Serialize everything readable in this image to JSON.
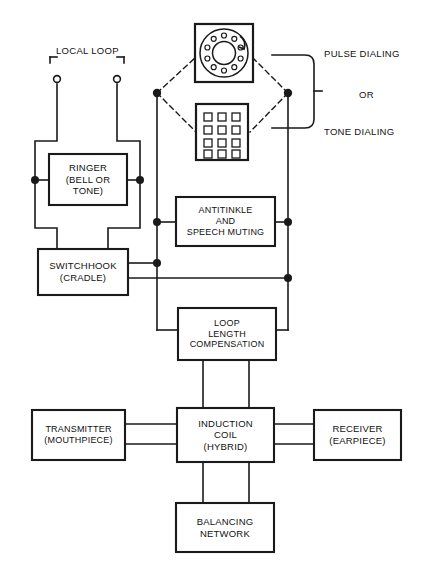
{
  "diagram": {
    "stroke_color": "#1a1a1a",
    "background_color": "#ffffff",
    "blocks": [
      {
        "id": "ringer",
        "lines": [
          "RINGER",
          "(BELL OR",
          "TONE)"
        ],
        "x": 49,
        "y": 154,
        "w": 78,
        "h": 51
      },
      {
        "id": "switchhook",
        "lines": [
          "SWITCHHOOK",
          "(CRADLE)"
        ],
        "x": 38,
        "y": 249,
        "w": 90,
        "h": 46
      },
      {
        "id": "antitinkle",
        "lines": [
          "ANTITINKLE",
          "AND",
          "SPEECH MUTING"
        ],
        "x": 176,
        "y": 197,
        "w": 99,
        "h": 49
      },
      {
        "id": "loop-length",
        "lines": [
          "LOOP",
          "LENGTH",
          "COMPENSATION"
        ],
        "x": 178,
        "y": 308,
        "w": 98,
        "h": 52
      },
      {
        "id": "transmitter",
        "lines": [
          "TRANSMITTER",
          "(MOUTHPIECE)"
        ],
        "x": 32,
        "y": 410,
        "w": 93,
        "h": 50
      },
      {
        "id": "induction-coil",
        "lines": [
          "INDUCTION",
          "COIL",
          "(HYBRID)"
        ],
        "x": 177,
        "y": 408,
        "w": 97,
        "h": 54
      },
      {
        "id": "receiver",
        "lines": [
          "RECEIVER",
          "(EARPIECE)",
          ""
        ],
        "x": 314,
        "y": 410,
        "w": 87,
        "h": 50
      },
      {
        "id": "balancing",
        "lines": [
          "BALANCING",
          "NETWORK"
        ],
        "x": 176,
        "y": 503,
        "w": 98,
        "h": 49
      }
    ],
    "annotations": [
      {
        "id": "local-loop",
        "lines": [
          "LOCAL",
          "LOOP"
        ],
        "x": 56,
        "y": 45,
        "w": 62,
        "align": "center"
      },
      {
        "id": "pulse-dialing",
        "lines": [
          "PULSE DIALING"
        ],
        "x": 324,
        "y": 48,
        "w": 100,
        "align": "left"
      },
      {
        "id": "or",
        "lines": [
          "OR"
        ],
        "x": 359,
        "y": 89,
        "w": 30,
        "align": "left"
      },
      {
        "id": "tone-dialing",
        "lines": [
          "TONE DIALING"
        ],
        "x": 324,
        "y": 126,
        "w": 100,
        "align": "left"
      }
    ],
    "devices": [
      {
        "id": "rotary-dial",
        "name": "rotary-dial-icon",
        "x": 195,
        "y": 24,
        "w": 58,
        "h": 58,
        "finger_holes": 10
      },
      {
        "id": "keypad",
        "name": "keypad-icon",
        "x": 196,
        "y": 104,
        "w": 52,
        "h": 56,
        "rows": 4,
        "cols": 3
      }
    ],
    "terminals": [
      {
        "id": "terminal-tip",
        "x": 57,
        "y": 79
      },
      {
        "id": "terminal-ring",
        "x": 117,
        "y": 79
      }
    ],
    "junctions": [
      {
        "id": "j-ringer-left",
        "x": 35,
        "y": 180
      },
      {
        "id": "j-ringer-right",
        "x": 140,
        "y": 180
      },
      {
        "id": "j-dial-left",
        "x": 157,
        "y": 93
      },
      {
        "id": "j-dial-right",
        "x": 288,
        "y": 93
      },
      {
        "id": "j-antitinkle-left",
        "x": 157,
        "y": 222
      },
      {
        "id": "j-antitinkle-right",
        "x": 288,
        "y": 222
      },
      {
        "id": "j-switchhook-bus",
        "x": 157,
        "y": 263
      },
      {
        "id": "j-lower-bus",
        "x": 288,
        "y": 278
      }
    ],
    "buses": [
      {
        "id": "left-bus",
        "x": 157
      },
      {
        "id": "right-bus",
        "x": 288
      }
    ]
  }
}
